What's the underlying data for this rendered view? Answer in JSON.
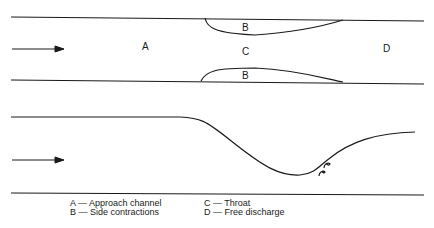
{
  "plan_view": {
    "labels": {
      "a": "A",
      "b_top": "B",
      "b_bottom": "B",
      "c": "C",
      "d": "D"
    },
    "flow_arrow": "arrow-right-icon"
  },
  "profile_view": {
    "flow_arrow": "arrow-right-icon"
  },
  "legend": {
    "items": [
      "A — Approach channel",
      "B — Side contractions",
      "C — Throat",
      "D — Free discharge"
    ]
  },
  "colors": {
    "line": "#1a1a1a",
    "background": "#ffffff"
  }
}
